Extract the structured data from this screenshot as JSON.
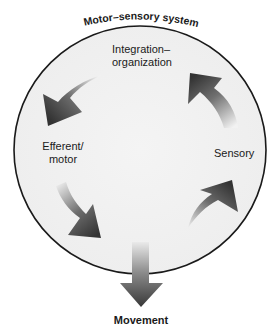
{
  "diagram": {
    "title": "Motor–sensory system",
    "nodes": {
      "integration": {
        "line1": "Integration–",
        "line2": "organization"
      },
      "efferent": {
        "line1": "Efferent/",
        "line2": "motor"
      },
      "sensory": {
        "label": "Sensory"
      }
    },
    "output": {
      "label": "Movement"
    },
    "cycle_order": [
      "Sensory",
      "Integration–organization",
      "Efferent/motor",
      "Movement"
    ],
    "arrows": [
      {
        "name": "integration-to-efferent",
        "direction": "down-left"
      },
      {
        "name": "efferent-to-movement",
        "direction": "down-right"
      },
      {
        "name": "sensory-to-integration",
        "direction": "up-left"
      },
      {
        "name": "into-sensory",
        "direction": "up-right"
      },
      {
        "name": "movement-output",
        "direction": "down"
      }
    ],
    "colors": {
      "circle_fill": "#f1f1f1",
      "circle_stroke": "#1a1a1a",
      "arrow_dark": "#3a3a3a",
      "arrow_light": "#e6e6e6",
      "text": "#1a1a1a"
    }
  }
}
